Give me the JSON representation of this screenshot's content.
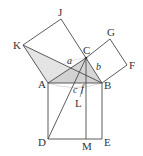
{
  "diagram": {
    "title": "",
    "colors": {
      "line": "#4a4a4a",
      "shade_light": "#e2e2e2",
      "shade_dark": "#c9c9c9",
      "arc": "#d0d0d0",
      "text": "#333333"
    },
    "points": {
      "A": {
        "label": "A",
        "x": 48,
        "y": 83
      },
      "B": {
        "label": "B",
        "x": 102,
        "y": 83
      },
      "C": {
        "label": "C",
        "x": 86,
        "y": 58
      },
      "J": {
        "label": "J",
        "x": 61,
        "y": 19
      },
      "K": {
        "label": "K",
        "x": 23,
        "y": 45
      },
      "G": {
        "label": "G",
        "x": 110,
        "y": 39
      },
      "F": {
        "label": "F",
        "x": 127,
        "y": 65
      },
      "D": {
        "label": "D",
        "x": 48,
        "y": 139
      },
      "M": {
        "label": "M",
        "x": 86,
        "y": 139
      },
      "E": {
        "label": "E",
        "x": 102,
        "y": 139
      },
      "L": {
        "label": "L",
        "x": 86,
        "y": 83
      }
    },
    "side_labels": {
      "a": "a",
      "b": "b",
      "c": "c",
      "f": "f"
    },
    "labels": {
      "J": "J",
      "K": "K",
      "C": "C",
      "G": "G",
      "F": "F",
      "A": "A",
      "B": "B",
      "L": "L",
      "D": "D",
      "M": "M",
      "E": "E"
    }
  }
}
